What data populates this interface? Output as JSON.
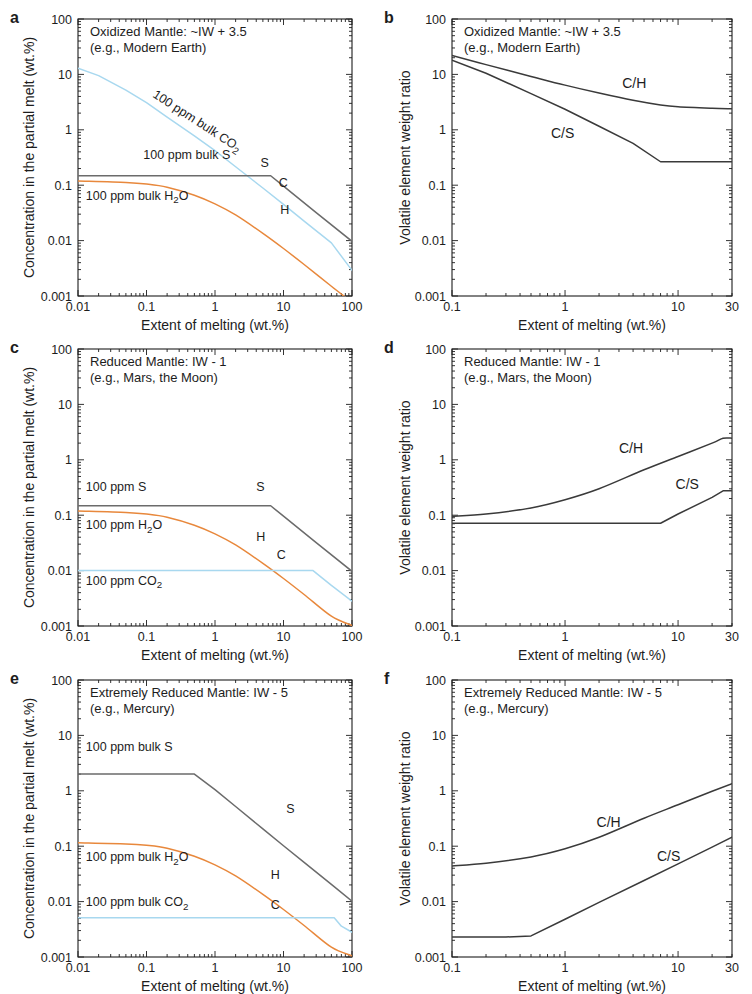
{
  "figure": {
    "width": 752,
    "height": 994,
    "background": "#ffffff",
    "colors": {
      "sulfur": "#6b6b6b",
      "hydrogen": "#e8883c",
      "carbon": "#a8d8ef",
      "ratio_line": "#3a3a3a",
      "axis": "#1d1d1d",
      "text": "#1d1d1d"
    }
  },
  "panels": [
    {
      "id": "a",
      "letter": "a",
      "title_line1": "Oxidized Mantle: ~IW + 3.5",
      "title_line2": "(e.g., Modern Earth)",
      "xlabel": "Extent of melting (wt.%)",
      "ylabel": "Concentration in the partial melt (wt.%)",
      "xticks": [
        "0.01",
        "0.1",
        "1",
        "10",
        "100"
      ],
      "yticks": [
        "0.001",
        "0.01",
        "0.1",
        "1",
        "10",
        "100"
      ],
      "annotations": [
        "100 ppm bulk CO",
        "100 ppm bulk S",
        "100 ppm bulk H"
      ],
      "annot_co2": "100 ppm bulk CO",
      "annot_co2_sub": "2",
      "annot_s": "100 ppm bulk S",
      "annot_h2o": "100 ppm bulk H",
      "annot_h2o_sub": "2",
      "annot_h2o_tail": "O",
      "curve_labels": {
        "s": "S",
        "c": "C",
        "h": "H"
      }
    },
    {
      "id": "b",
      "letter": "b",
      "title_line1": "Oxidized Mantle: ~IW + 3.5",
      "title_line2": "(e.g., Modern Earth)",
      "xlabel": "Extent of melting (wt.%)",
      "ylabel": "Volatile element weight ratio",
      "xticks": [
        "0.1",
        "1",
        "10",
        "30"
      ],
      "yticks": [
        "0.001",
        "0.01",
        "0.1",
        "1",
        "10",
        "100"
      ],
      "curve_labels": {
        "ch": "C/H",
        "cs": "C/S"
      }
    },
    {
      "id": "c",
      "letter": "c",
      "title_line1": "Reduced Mantle: IW - 1",
      "title_line2": "(e.g., Mars, the Moon)",
      "xlabel": "Extent of melting (wt.%)",
      "ylabel": "Concentration in the partial melt (wt.%)",
      "xticks": [
        "0.01",
        "0.1",
        "1",
        "10",
        "100"
      ],
      "yticks": [
        "0.001",
        "0.01",
        "0.1",
        "1",
        "10",
        "100"
      ],
      "annot_s": "100 ppm S",
      "annot_h2o": "100 ppm H",
      "annot_h2o_sub": "2",
      "annot_h2o_tail": "O",
      "annot_co2": "100 ppm CO",
      "annot_co2_sub": "2",
      "curve_labels": {
        "s": "S",
        "c": "C",
        "h": "H"
      }
    },
    {
      "id": "d",
      "letter": "d",
      "title_line1": "Reduced Mantle: IW - 1",
      "title_line2": "(e.g., Mars, the Moon)",
      "xlabel": "Extent of melting (wt.%)",
      "ylabel": "Volatile element weight ratio",
      "xticks": [
        "0.1",
        "1",
        "10",
        "30"
      ],
      "yticks": [
        "0.001",
        "0.01",
        "0.1",
        "1",
        "10",
        "100"
      ],
      "curve_labels": {
        "ch": "C/H",
        "cs": "C/S"
      }
    },
    {
      "id": "e",
      "letter": "e",
      "title_line1": "Extremely Reduced Mantle: IW - 5",
      "title_line2": "(e.g., Mercury)",
      "xlabel": "Extent of melting (wt.%)",
      "ylabel": "Concentration in the partial melt (wt.%)",
      "xticks": [
        "0.01",
        "0.1",
        "1",
        "10",
        "100"
      ],
      "yticks": [
        "0.001",
        "0.01",
        "0.1",
        "1",
        "10",
        "100"
      ],
      "annot_s": "100 ppm bulk S",
      "annot_h2o": "100 ppm bulk H",
      "annot_h2o_sub": "2",
      "annot_h2o_tail": "O",
      "annot_co2": "100 ppm bulk CO",
      "annot_co2_sub": "2",
      "curve_labels": {
        "s": "S",
        "c": "C",
        "h": "H"
      }
    },
    {
      "id": "f",
      "letter": "f",
      "title_line1": "Extremely Reduced Mantle: IW - 5",
      "title_line2": "(e.g., Mercury)",
      "xlabel": "Extent of melting (wt.%)",
      "ylabel": "Volatile element weight ratio",
      "xticks": [
        "0.1",
        "1",
        "10",
        "30"
      ],
      "yticks": [
        "0.001",
        "0.01",
        "0.1",
        "1",
        "10",
        "100"
      ],
      "curve_labels": {
        "ch": "C/H",
        "cs": "C/S"
      }
    }
  ],
  "chart_data": [
    {
      "panel": "a",
      "type": "line",
      "title": "Oxidized Mantle: ~IW + 3.5 (e.g., Modern Earth)",
      "xlabel": "Extent of melting (wt.%)",
      "ylabel": "Concentration in the partial melt (wt.%)",
      "xscale": "log",
      "yscale": "log",
      "xlim": [
        0.01,
        100
      ],
      "ylim": [
        0.001,
        100
      ],
      "grid": false,
      "legend": "inline curve labels",
      "series": [
        {
          "name": "C (100 ppm bulk CO2)",
          "label": "C",
          "color": "#a8d8ef",
          "x": [
            0.01,
            0.02,
            0.05,
            0.1,
            0.2,
            0.5,
            1,
            2,
            5,
            10,
            20,
            50,
            100
          ],
          "y": [
            13.0,
            9.5,
            5.2,
            3.1,
            1.7,
            0.78,
            0.42,
            0.215,
            0.089,
            0.045,
            0.0225,
            0.0091,
            0.0029
          ]
        },
        {
          "name": "S (100 ppm bulk S)",
          "label": "S",
          "color": "#6b6b6b",
          "x": [
            0.01,
            0.1,
            1,
            4,
            6.5,
            10,
            30,
            100
          ],
          "y": [
            0.148,
            0.148,
            0.148,
            0.148,
            0.148,
            0.096,
            0.032,
            0.0097
          ]
        },
        {
          "name": "H (100 ppm bulk H2O)",
          "label": "H",
          "color": "#e8883c",
          "x": [
            0.01,
            0.05,
            0.1,
            0.2,
            0.5,
            1,
            2,
            5,
            10,
            20,
            50,
            100
          ],
          "y": [
            0.119,
            0.112,
            0.105,
            0.092,
            0.066,
            0.046,
            0.029,
            0.0135,
            0.0072,
            0.0037,
            0.0015,
            0.00077
          ]
        }
      ],
      "annotations": [
        {
          "text": "100 ppm bulk CO2",
          "near": "C curve",
          "rotated": true
        },
        {
          "text": "100 ppm bulk S",
          "near": "S curve"
        },
        {
          "text": "100 ppm bulk H2O",
          "near": "H curve"
        }
      ]
    },
    {
      "panel": "b",
      "type": "line",
      "title": "Oxidized Mantle: ~IW + 3.5 (e.g., Modern Earth)",
      "xlabel": "Extent of melting (wt.%)",
      "ylabel": "Volatile element weight ratio",
      "xscale": "log",
      "yscale": "log",
      "xlim": [
        0.1,
        30
      ],
      "ylim": [
        0.001,
        100
      ],
      "grid": false,
      "series": [
        {
          "name": "C/H",
          "label": "C/H",
          "color": "#3a3a3a",
          "x": [
            0.1,
            0.2,
            0.5,
            1,
            2,
            4,
            7,
            10,
            20,
            30
          ],
          "y": [
            22.0,
            15.0,
            9.2,
            6.4,
            4.6,
            3.4,
            2.8,
            2.6,
            2.45,
            2.4
          ]
        },
        {
          "name": "C/S",
          "label": "C/S",
          "color": "#3a3a3a",
          "x": [
            0.1,
            0.2,
            0.5,
            1,
            2,
            4,
            7,
            10,
            20,
            30
          ],
          "y": [
            18.0,
            10.5,
            4.5,
            2.35,
            1.16,
            0.57,
            0.265,
            0.265,
            0.265,
            0.265
          ]
        }
      ]
    },
    {
      "panel": "c",
      "type": "line",
      "title": "Reduced Mantle: IW - 1 (e.g., Mars, the Moon)",
      "xlabel": "Extent of melting (wt.%)",
      "ylabel": "Concentration in the partial melt (wt.%)",
      "xscale": "log",
      "yscale": "log",
      "xlim": [
        0.01,
        100
      ],
      "ylim": [
        0.001,
        100
      ],
      "grid": false,
      "series": [
        {
          "name": "S (100 ppm S)",
          "label": "S",
          "color": "#6b6b6b",
          "x": [
            0.01,
            0.1,
            1,
            4,
            6.5,
            10,
            30,
            100
          ],
          "y": [
            0.148,
            0.148,
            0.148,
            0.148,
            0.148,
            0.096,
            0.032,
            0.0097
          ]
        },
        {
          "name": "H (100 ppm H2O)",
          "label": "H",
          "color": "#e8883c",
          "x": [
            0.01,
            0.05,
            0.1,
            0.2,
            0.5,
            1,
            2,
            5,
            10,
            20,
            50,
            100
          ],
          "y": [
            0.119,
            0.112,
            0.105,
            0.092,
            0.066,
            0.046,
            0.029,
            0.0135,
            0.0072,
            0.0037,
            0.0015,
            0.00102
          ]
        },
        {
          "name": "C (100 ppm CO2)",
          "label": "C",
          "color": "#a8d8ef",
          "x": [
            0.01,
            1,
            10,
            27,
            50,
            100
          ],
          "y": [
            0.01,
            0.01,
            0.01,
            0.01,
            0.0054,
            0.0028
          ]
        }
      ],
      "annotations": [
        {
          "text": "100 ppm S",
          "near": "S curve"
        },
        {
          "text": "100 ppm H2O",
          "near": "H curve"
        },
        {
          "text": "100 ppm CO2",
          "near": "C curve"
        }
      ]
    },
    {
      "panel": "d",
      "type": "line",
      "title": "Reduced Mantle: IW - 1 (e.g., Mars, the Moon)",
      "xlabel": "Extent of melting (wt.%)",
      "ylabel": "Volatile element weight ratio",
      "xscale": "log",
      "yscale": "log",
      "xlim": [
        0.1,
        30
      ],
      "ylim": [
        0.001,
        100
      ],
      "grid": false,
      "series": [
        {
          "name": "C/H",
          "label": "C/H",
          "color": "#3a3a3a",
          "x": [
            0.1,
            0.2,
            0.5,
            1,
            2,
            5,
            10,
            20,
            25,
            30
          ],
          "y": [
            0.095,
            0.105,
            0.135,
            0.19,
            0.3,
            0.66,
            1.15,
            2.0,
            2.45,
            2.45
          ]
        },
        {
          "name": "C/S",
          "label": "C/S",
          "color": "#3a3a3a",
          "x": [
            0.1,
            1,
            5,
            7,
            10,
            20,
            25,
            30
          ],
          "y": [
            0.0715,
            0.0715,
            0.0715,
            0.0715,
            0.105,
            0.21,
            0.275,
            0.275
          ]
        }
      ]
    },
    {
      "panel": "e",
      "type": "line",
      "title": "Extremely Reduced Mantle: IW - 5 (e.g., Mercury)",
      "xlabel": "Extent of melting (wt.%)",
      "ylabel": "Concentration in the partial melt (wt.%)",
      "xscale": "log",
      "yscale": "log",
      "xlim": [
        0.01,
        100
      ],
      "ylim": [
        0.001,
        100
      ],
      "grid": false,
      "series": [
        {
          "name": "S (100 ppm bulk S)",
          "label": "S",
          "color": "#6b6b6b",
          "x": [
            0.01,
            0.1,
            0.5,
            1,
            2,
            5,
            10,
            20,
            50,
            100
          ],
          "y": [
            2.0,
            2.0,
            2.0,
            1.05,
            0.52,
            0.205,
            0.102,
            0.051,
            0.0205,
            0.0102
          ]
        },
        {
          "name": "H (100 ppm bulk H2O)",
          "label": "H",
          "color": "#e8883c",
          "x": [
            0.01,
            0.05,
            0.1,
            0.2,
            0.5,
            1,
            2,
            5,
            10,
            20,
            50,
            100
          ],
          "y": [
            0.115,
            0.11,
            0.104,
            0.092,
            0.066,
            0.046,
            0.029,
            0.0135,
            0.0072,
            0.0037,
            0.0015,
            0.00105
          ]
        },
        {
          "name": "C (100 ppm bulk CO2)",
          "label": "C",
          "color": "#a8d8ef",
          "x": [
            0.01,
            1,
            10,
            55,
            70,
            100
          ],
          "y": [
            0.0051,
            0.0051,
            0.0051,
            0.0051,
            0.0036,
            0.0028
          ]
        }
      ],
      "annotations": [
        {
          "text": "100 ppm bulk S",
          "near": "S curve"
        },
        {
          "text": "100 ppm bulk H2O",
          "near": "H curve"
        },
        {
          "text": "100 ppm bulk CO2",
          "near": "C curve"
        }
      ]
    },
    {
      "panel": "f",
      "type": "line",
      "title": "Extremely Reduced Mantle: IW - 5 (e.g., Mercury)",
      "xlabel": "Extent of melting (wt.%)",
      "ylabel": "Volatile element weight ratio",
      "xscale": "log",
      "yscale": "log",
      "xlim": [
        0.1,
        30
      ],
      "ylim": [
        0.001,
        100
      ],
      "grid": false,
      "series": [
        {
          "name": "C/H",
          "label": "C/H",
          "color": "#3a3a3a",
          "x": [
            0.1,
            0.2,
            0.5,
            1,
            2,
            5,
            10,
            20,
            30
          ],
          "y": [
            0.044,
            0.049,
            0.064,
            0.09,
            0.145,
            0.32,
            0.56,
            0.98,
            1.35
          ]
        },
        {
          "name": "C/S",
          "label": "C/S",
          "color": "#3a3a3a",
          "x": [
            0.1,
            0.3,
            0.5,
            1,
            2,
            5,
            10,
            20,
            30
          ],
          "y": [
            0.0023,
            0.0023,
            0.0024,
            0.0048,
            0.0097,
            0.024,
            0.048,
            0.096,
            0.145
          ]
        }
      ]
    }
  ]
}
